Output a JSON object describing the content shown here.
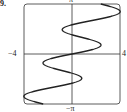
{
  "problem_number": "9.",
  "chart_data": {
    "type": "line",
    "title": "",
    "xlabel": "",
    "ylabel": "",
    "xlim": [
      -4,
      4
    ],
    "ylim": [
      -3.14159,
      3.14159
    ],
    "tick_labels": {
      "left": "−4",
      "right": "4",
      "top": "π",
      "bottom": "−π"
    },
    "grid": false,
    "series": [
      {
        "name": "curve",
        "description": "x as an oscillating function of y, from (-4,-π) to (4,π)",
        "points": []
      }
    ]
  }
}
